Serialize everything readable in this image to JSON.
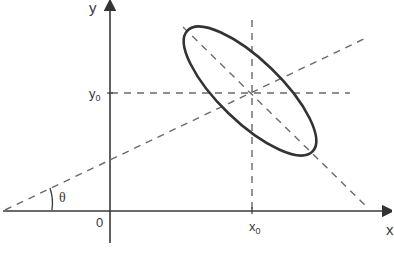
{
  "diagram": {
    "type": "coordinate-geometry",
    "axes": {
      "x_label": "x",
      "y_label": "y",
      "origin_label": "0"
    },
    "center": {
      "x_label_main": "x",
      "x_label_sub": "0",
      "y_label_main": "y",
      "y_label_sub": "0"
    },
    "angle_label": "θ",
    "colors": {
      "axis": "#3a3a3a",
      "ellipse": "#333333",
      "dashed": "#6a6a6a",
      "background": "#ffffff"
    }
  }
}
